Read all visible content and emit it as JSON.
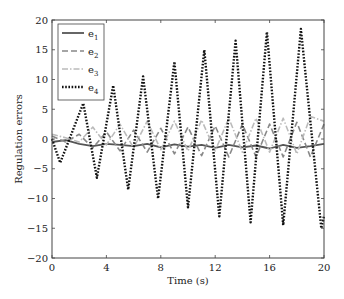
{
  "chart_data": {
    "type": "line",
    "title": "",
    "xlabel": "Time (s)",
    "ylabel": "Regulation errors",
    "xlim": [
      0,
      20
    ],
    "ylim": [
      -20,
      20
    ],
    "xticks": [
      0,
      4,
      8,
      12,
      16,
      20
    ],
    "yticks": [
      -20,
      -15,
      -10,
      -5,
      0,
      5,
      10,
      15,
      20
    ],
    "grid": false,
    "legend_position": "upper left",
    "series": [
      {
        "name": "e1",
        "style": "solid",
        "color": "#555555",
        "x": [
          0,
          1,
          2,
          3,
          4,
          5,
          6,
          7,
          8,
          9,
          10,
          11,
          12,
          13,
          14,
          15,
          16,
          17,
          18,
          19,
          20
        ],
        "y": [
          -0.5,
          -0.2,
          -0.8,
          -1.2,
          -0.8,
          -1.0,
          -1.2,
          -0.8,
          -1.4,
          -0.9,
          -1.3,
          -1.0,
          -1.5,
          -1.0,
          -1.4,
          -1.1,
          -1.6,
          -1.0,
          -1.5,
          -1.2,
          -0.8
        ]
      },
      {
        "name": "e2",
        "style": "dashed",
        "color": "#888888",
        "x": [
          0,
          1,
          2,
          3,
          4,
          5,
          6,
          7,
          8,
          9,
          10,
          11,
          12,
          13,
          14,
          15,
          16,
          17,
          18,
          19,
          20
        ],
        "y": [
          0.5,
          -0.5,
          0.8,
          -1.5,
          1.2,
          -2.0,
          1.5,
          -2.2,
          1.8,
          -2.5,
          2.0,
          -2.8,
          2.2,
          -3.0,
          2.5,
          -3.0,
          2.5,
          -3.0,
          2.8,
          -3.0,
          2.5
        ]
      },
      {
        "name": "e3",
        "style": "dash-dot",
        "color": "#bbbbbb",
        "x": [
          0,
          1,
          2,
          3,
          4,
          5,
          6,
          7,
          8,
          9,
          10,
          11,
          12,
          13,
          14,
          15,
          16,
          17,
          18,
          19,
          20
        ],
        "y": [
          0.8,
          0.2,
          -0.5,
          2.0,
          -1.0,
          2.5,
          -1.5,
          3.0,
          -1.8,
          3.0,
          -2.0,
          3.2,
          -2.0,
          3.5,
          -2.2,
          3.5,
          -2.2,
          3.5,
          -2.5,
          3.8,
          3.0
        ]
      },
      {
        "name": "e4",
        "style": "dotted",
        "color": "#111111",
        "x": [
          0,
          0.6,
          2.3,
          3.3,
          4.5,
          5.6,
          6.7,
          7.8,
          9.0,
          10.0,
          11.2,
          12.3,
          13.5,
          14.6,
          15.8,
          17.0,
          18.3,
          19.8,
          20
        ],
        "y": [
          0,
          -4,
          6,
          -6.5,
          9,
          -8.5,
          10.5,
          -10,
          13,
          -11.5,
          15,
          -13,
          16.5,
          -14,
          18,
          -14.5,
          18.5,
          -15,
          -13
        ]
      }
    ]
  },
  "legend": {
    "items": [
      {
        "label": "e",
        "sub": "1"
      },
      {
        "label": "e",
        "sub": "2"
      },
      {
        "label": "e",
        "sub": "3"
      },
      {
        "label": "e",
        "sub": "4"
      }
    ]
  }
}
